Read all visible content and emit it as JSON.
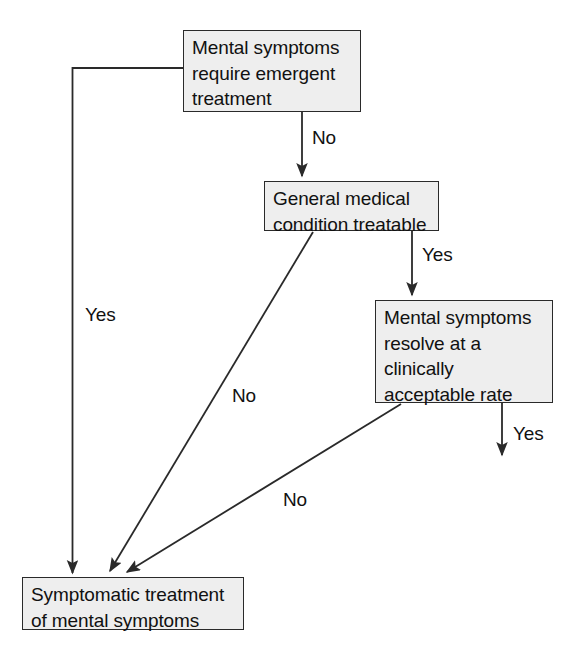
{
  "diagram": {
    "type": "flowchart",
    "background_color": "#ffffff",
    "node_fill_color": "#eeeeee",
    "node_border_color": "#2a2a2a",
    "text_color": "#111111",
    "nodes": [
      {
        "id": "emergent",
        "text": "Mental symptoms\nrequire emergent\ntreatment",
        "x": 183,
        "y": 30,
        "width": 178,
        "height": 82
      },
      {
        "id": "gmc",
        "text": "General medical\ncondition treatable",
        "x": 264,
        "y": 181,
        "width": 175,
        "height": 50
      },
      {
        "id": "resolve",
        "text": "Mental symptoms\nresolve at a\nclinically\nacceptable rate",
        "x": 375,
        "y": 300,
        "width": 178,
        "height": 103
      },
      {
        "id": "symptomatic",
        "text": "Symptomatic treatment\nof mental symptoms",
        "x": 22,
        "y": 577,
        "width": 222,
        "height": 53
      }
    ],
    "edges": [
      {
        "id": "emergent-yes",
        "label": "Yes",
        "from": "emergent",
        "to": "symptomatic",
        "label_x": 85,
        "label_y": 305
      },
      {
        "id": "emergent-no",
        "label": "No",
        "from": "emergent",
        "to": "gmc",
        "label_x": 312,
        "label_y": 128
      },
      {
        "id": "gmc-yes",
        "label": "Yes",
        "from": "gmc",
        "to": "resolve",
        "label_x": 422,
        "label_y": 245
      },
      {
        "id": "gmc-no",
        "label": "No",
        "from": "gmc",
        "to": "symptomatic",
        "label_x": 232,
        "label_y": 386
      },
      {
        "id": "resolve-no",
        "label": "No",
        "from": "resolve",
        "to": "symptomatic",
        "label_x": 283,
        "label_y": 490
      },
      {
        "id": "resolve-yes",
        "label": "Yes",
        "from": "resolve",
        "to": null,
        "label_x": 513,
        "label_y": 424
      }
    ]
  }
}
